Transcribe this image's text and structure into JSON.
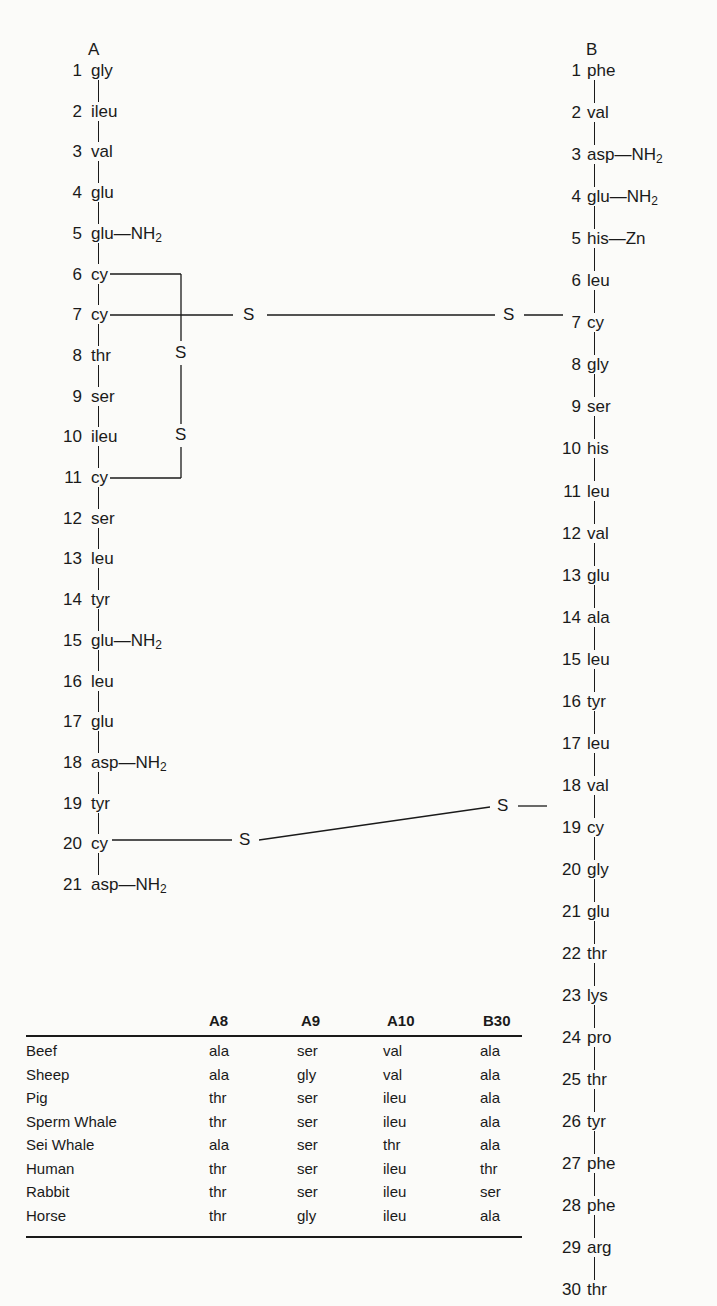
{
  "chain_a": {
    "title": "A",
    "residues": [
      {
        "n": "1",
        "name": "gly"
      },
      {
        "n": "2",
        "name": "ileu"
      },
      {
        "n": "3",
        "name": "val"
      },
      {
        "n": "4",
        "name": "glu"
      },
      {
        "n": "5",
        "name": "glu",
        "side": "NH",
        "side_sub": "2"
      },
      {
        "n": "6",
        "name": "cy"
      },
      {
        "n": "7",
        "name": "cy"
      },
      {
        "n": "8",
        "name": "thr"
      },
      {
        "n": "9",
        "name": "ser"
      },
      {
        "n": "10",
        "name": "ileu"
      },
      {
        "n": "11",
        "name": "cy"
      },
      {
        "n": "12",
        "name": "ser"
      },
      {
        "n": "13",
        "name": "leu"
      },
      {
        "n": "14",
        "name": "tyr"
      },
      {
        "n": "15",
        "name": "glu",
        "side": "NH",
        "side_sub": "2"
      },
      {
        "n": "16",
        "name": "leu"
      },
      {
        "n": "17",
        "name": "glu"
      },
      {
        "n": "18",
        "name": "asp",
        "side": "NH",
        "side_sub": "2"
      },
      {
        "n": "19",
        "name": "tyr"
      },
      {
        "n": "20",
        "name": "cy"
      },
      {
        "n": "21",
        "name": "asp",
        "side": "NH",
        "side_sub": "2"
      }
    ]
  },
  "chain_b": {
    "title": "B",
    "residues": [
      {
        "n": "1",
        "name": "phe"
      },
      {
        "n": "2",
        "name": "val"
      },
      {
        "n": "3",
        "name": "asp",
        "side": "NH",
        "side_sub": "2"
      },
      {
        "n": "4",
        "name": "glu",
        "side": "NH",
        "side_sub": "2"
      },
      {
        "n": "5",
        "name": "his",
        "side": "Zn"
      },
      {
        "n": "6",
        "name": "leu"
      },
      {
        "n": "7",
        "name": "cy"
      },
      {
        "n": "8",
        "name": "gly"
      },
      {
        "n": "9",
        "name": "ser"
      },
      {
        "n": "10",
        "name": "his"
      },
      {
        "n": "11",
        "name": "leu"
      },
      {
        "n": "12",
        "name": "val"
      },
      {
        "n": "13",
        "name": "glu"
      },
      {
        "n": "14",
        "name": "ala"
      },
      {
        "n": "15",
        "name": "leu"
      },
      {
        "n": "16",
        "name": "tyr"
      },
      {
        "n": "17",
        "name": "leu"
      },
      {
        "n": "18",
        "name": "val"
      },
      {
        "n": "19",
        "name": "cy"
      },
      {
        "n": "20",
        "name": "gly"
      },
      {
        "n": "21",
        "name": "glu"
      },
      {
        "n": "22",
        "name": "thr"
      },
      {
        "n": "23",
        "name": "lys"
      },
      {
        "n": "24",
        "name": "pro"
      },
      {
        "n": "25",
        "name": "thr"
      },
      {
        "n": "26",
        "name": "tyr"
      },
      {
        "n": "27",
        "name": "phe"
      },
      {
        "n": "28",
        "name": "phe"
      },
      {
        "n": "29",
        "name": "arg"
      },
      {
        "n": "30",
        "name": "thr"
      }
    ]
  },
  "disulfide_bonds": {
    "intra_a_6_11": {
      "s1": "S",
      "s2": "S"
    },
    "inter_a7_b7": {
      "s1": "S",
      "s2": "S"
    },
    "inter_a20_b19": {
      "s1": "S",
      "s2": "S"
    }
  },
  "species_table": {
    "columns": [
      "A8",
      "A9",
      "A10",
      "B30"
    ],
    "rows": [
      {
        "species": "Beef",
        "values": [
          "ala",
          "ser",
          "val",
          "ala"
        ]
      },
      {
        "species": "Sheep",
        "values": [
          "ala",
          "gly",
          "val",
          "ala"
        ]
      },
      {
        "species": "Pig",
        "values": [
          "thr",
          "ser",
          "ileu",
          "ala"
        ]
      },
      {
        "species": "Sperm Whale",
        "values": [
          "thr",
          "ser",
          "ileu",
          "ala"
        ]
      },
      {
        "species": "Sei Whale",
        "values": [
          "ala",
          "ser",
          "thr",
          "ala"
        ]
      },
      {
        "species": "Human",
        "values": [
          "thr",
          "ser",
          "ileu",
          "thr"
        ]
      },
      {
        "species": "Rabbit",
        "values": [
          "thr",
          "ser",
          "ileu",
          "ser"
        ]
      },
      {
        "species": "Horse",
        "values": [
          "thr",
          "gly",
          "ileu",
          "ala"
        ]
      }
    ]
  }
}
